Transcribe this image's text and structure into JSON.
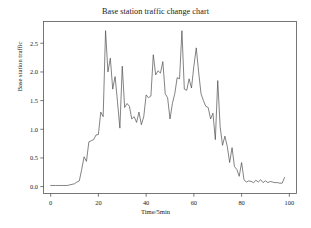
{
  "chart_data": {
    "type": "line",
    "title": "Base station traffic change chart",
    "xlabel": "Time/5min",
    "ylabel": "Base station traffic",
    "xlim": [
      -3,
      103
    ],
    "ylim": [
      -0.12,
      2.88
    ],
    "xticks": [
      0,
      20,
      40,
      60,
      80,
      100
    ],
    "xticklabels": [
      "0",
      "20",
      "40",
      "60",
      "80",
      "100"
    ],
    "yticks": [
      0.0,
      0.5,
      1.0,
      1.5,
      2.0,
      2.5
    ],
    "yticklabels": [
      "0.0",
      "0.5",
      "1.0",
      "1.5",
      "2.0",
      "2.5"
    ],
    "grid": false,
    "legend": false,
    "line_color": "#4d4d4d",
    "line_width": 0.7,
    "frame": true,
    "series": [
      {
        "name": "Base station traffic",
        "x": [
          0,
          1,
          2,
          3,
          4,
          5,
          6,
          7,
          8,
          9,
          10,
          11,
          12,
          13,
          14,
          15,
          16,
          17,
          18,
          19,
          20,
          21,
          22,
          23,
          24,
          25,
          26,
          27,
          28,
          29,
          30,
          31,
          32,
          33,
          34,
          35,
          36,
          37,
          38,
          39,
          40,
          41,
          42,
          43,
          44,
          45,
          46,
          47,
          48,
          49,
          50,
          51,
          52,
          53,
          54,
          55,
          56,
          57,
          58,
          59,
          60,
          61,
          62,
          63,
          64,
          65,
          66,
          67,
          68,
          69,
          70,
          71,
          72,
          73,
          74,
          75,
          76,
          77,
          78,
          79,
          80,
          81,
          82,
          83,
          84,
          85,
          86,
          87,
          88,
          89,
          90,
          91,
          92,
          93,
          94,
          95,
          96,
          97,
          98
        ],
        "values": [
          0.02,
          0.02,
          0.02,
          0.02,
          0.02,
          0.02,
          0.02,
          0.02,
          0.03,
          0.04,
          0.05,
          0.08,
          0.1,
          0.3,
          0.52,
          0.44,
          0.78,
          0.8,
          0.82,
          0.9,
          0.91,
          1.3,
          1.22,
          2.72,
          2.0,
          2.24,
          1.7,
          1.92,
          1.48,
          1.02,
          2.1,
          1.38,
          1.45,
          1.4,
          1.18,
          1.22,
          1.12,
          1.3,
          1.08,
          1.22,
          1.6,
          1.55,
          1.58,
          2.3,
          1.95,
          2.02,
          1.98,
          2.18,
          1.62,
          1.55,
          1.18,
          1.45,
          1.62,
          1.9,
          1.88,
          2.72,
          1.7,
          1.68,
          1.88,
          1.72,
          2.1,
          2.42,
          2.0,
          1.62,
          1.5,
          1.4,
          1.38,
          1.18,
          1.28,
          0.82,
          1.85,
          1.05,
          0.72,
          0.88,
          0.7,
          0.42,
          0.68,
          0.35,
          0.3,
          0.18,
          0.42,
          0.12,
          0.08,
          0.1,
          0.09,
          0.07,
          0.11,
          0.08,
          0.12,
          0.07,
          0.1,
          0.07,
          0.09,
          0.08,
          0.07,
          0.07,
          0.06,
          0.06,
          0.16
        ]
      }
    ]
  }
}
